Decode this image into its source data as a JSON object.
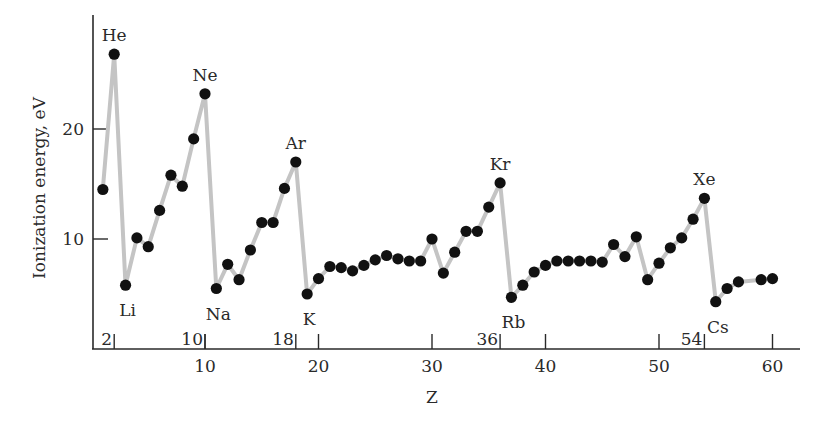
{
  "chart_data": {
    "type": "line",
    "title": "",
    "xlabel": "Z",
    "ylabel": "Ionization energy, eV",
    "xlim": [
      0,
      62
    ],
    "ylim": [
      0,
      29
    ],
    "grid": false,
    "legend": null,
    "x_ticks": [
      10,
      20,
      30,
      40,
      50,
      60
    ],
    "y_ticks": [
      10,
      20
    ],
    "period_ticks": [
      2,
      10,
      18,
      36,
      54
    ],
    "series": [
      {
        "name": "First ionization energy",
        "x": [
          1,
          2,
          3,
          4,
          5,
          6,
          7,
          8,
          9,
          10,
          11,
          12,
          13,
          14,
          15,
          16,
          17,
          18,
          19,
          20,
          21,
          22,
          23,
          24,
          25,
          26,
          27,
          28,
          29,
          30,
          31,
          32,
          33,
          34,
          35,
          36,
          37,
          38,
          39,
          40,
          41,
          42,
          43,
          44,
          45,
          46,
          47,
          48,
          49,
          50,
          51,
          52,
          53,
          54,
          55,
          56,
          57,
          59,
          60
        ],
        "values": [
          14.5,
          26.8,
          5.8,
          10.1,
          9.3,
          12.6,
          15.8,
          14.8,
          19.1,
          23.2,
          5.5,
          7.7,
          6.3,
          9.0,
          11.5,
          11.5,
          14.6,
          17.0,
          5.0,
          6.4,
          7.5,
          7.4,
          7.1,
          7.6,
          8.1,
          8.5,
          8.2,
          8.0,
          8.0,
          10.0,
          6.9,
          8.8,
          10.7,
          10.7,
          12.9,
          15.1,
          4.7,
          5.8,
          7.0,
          7.6,
          8.0,
          8.0,
          8.0,
          8.0,
          7.9,
          9.5,
          8.4,
          10.2,
          6.3,
          7.8,
          9.2,
          10.1,
          11.8,
          13.7,
          4.3,
          5.5,
          6.1,
          6.3,
          6.4
        ]
      }
    ],
    "annotations": [
      {
        "text": "He",
        "z": 2,
        "position": "above"
      },
      {
        "text": "Ne",
        "z": 10,
        "position": "above"
      },
      {
        "text": "Ar",
        "z": 18,
        "position": "above"
      },
      {
        "text": "Kr",
        "z": 36,
        "position": "above"
      },
      {
        "text": "Xe",
        "z": 54,
        "position": "above"
      },
      {
        "text": "Li",
        "z": 3,
        "position": "below"
      },
      {
        "text": "Na",
        "z": 11,
        "position": "below"
      },
      {
        "text": "K",
        "z": 19,
        "position": "below"
      },
      {
        "text": "Rb",
        "z": 37,
        "position": "below"
      },
      {
        "text": "Cs",
        "z": 55,
        "position": "below"
      }
    ]
  },
  "axes": {
    "x_title": "Z",
    "y_title": "Ionization energy, eV",
    "x_tick_labels": [
      "10",
      "20",
      "30",
      "40",
      "50",
      "60"
    ],
    "y_tick_labels": [
      "10",
      "20"
    ],
    "period_tick_labels": [
      "2",
      "10",
      "18",
      "36",
      "54"
    ]
  },
  "colors": {
    "line": "#c4c4c4",
    "point": "#111111",
    "axis": "#2a2a2a"
  }
}
